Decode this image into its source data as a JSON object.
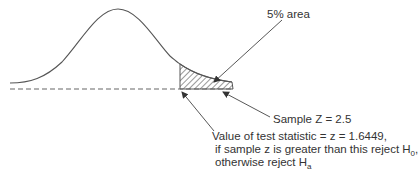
{
  "diagram": {
    "type": "normal-distribution-right-tail-test",
    "labels": {
      "area": "5% area",
      "sample": "Sample Z = 2.5",
      "critical_line1": "Value of test statistic = z = 1.6449,",
      "critical_line2_prefix": "if sample z is greater than this reject H",
      "critical_line2_sub": "0",
      "critical_line2_suffix": ",",
      "critical_line3_prefix": "otherwise reject H",
      "critical_line3_sub": "a"
    },
    "colors": {
      "curve": "#555555",
      "baseline": "#666666",
      "hatch": "#444444",
      "arrows": "#444444",
      "text": "#333333"
    },
    "values": {
      "alpha_percent": 5,
      "critical_z": 1.6449,
      "sample_z": 2.5
    }
  }
}
